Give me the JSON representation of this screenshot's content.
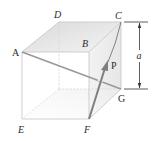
{
  "figure": {
    "type": "cube-with-force-vector",
    "vertices": {
      "A": {
        "label": "A",
        "x": 22,
        "y": 52
      },
      "B": {
        "label": "B",
        "x": 89,
        "y": 52
      },
      "C": {
        "label": "C",
        "x": 121,
        "y": 22
      },
      "D": {
        "label": "D",
        "x": 59,
        "y": 22
      },
      "E": {
        "label": "E",
        "x": 22,
        "y": 119
      },
      "F": {
        "label": "F",
        "x": 89,
        "y": 119
      },
      "G": {
        "label": "G",
        "x": 121,
        "y": 89
      }
    },
    "labels": {
      "A": "A",
      "B": "B",
      "C": "C",
      "D": "D",
      "E": "E",
      "F": "F",
      "G": "G",
      "force": "P",
      "dimension": "a"
    },
    "diagonal": {
      "from": "A",
      "to": "G",
      "color": "#9a9a9a"
    },
    "force_vector": {
      "name": "P",
      "from": "F",
      "toward": "C",
      "color": "#7f7f7f"
    },
    "dimension": {
      "label": "a",
      "spans": "C to G"
    },
    "colors": {
      "edge": "#c9c9c9",
      "face_shade": "#e6e6e6",
      "text": "#2a2a2a",
      "arrow": "#7f7f7f"
    }
  }
}
